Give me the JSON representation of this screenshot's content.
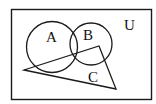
{
  "diagram": {
    "type": "venn",
    "universe_label": "U",
    "sets": [
      {
        "id": "A",
        "label": "A",
        "shape": "circle"
      },
      {
        "id": "B",
        "label": "B",
        "shape": "circle"
      },
      {
        "id": "C",
        "label": "C",
        "shape": "triangle"
      }
    ],
    "colors": {
      "stroke": "#1a1a1a",
      "background": "#ffffff"
    }
  }
}
